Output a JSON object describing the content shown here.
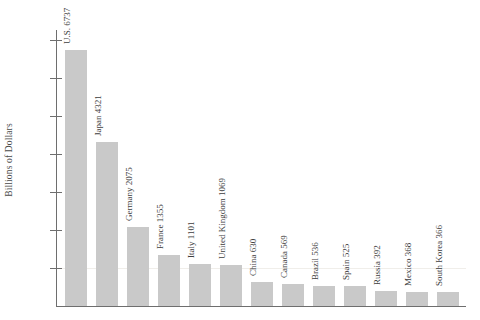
{
  "chart_data": {
    "type": "bar",
    "title": "",
    "subtitle": "",
    "xlabel": "",
    "ylabel": "Billions of Dollars",
    "ylim": [
      0,
      7400
    ],
    "grid": true,
    "legend": null,
    "tick_labels": [
      "7,000",
      "6,000",
      "5,000",
      "4,000",
      "3,000",
      "2,000",
      "1,000"
    ],
    "ticks": [
      7000,
      6000,
      5000,
      4000,
      3000,
      2000,
      1000
    ],
    "categories": [
      "U.S.",
      "Japan",
      "Germany",
      "France",
      "Italy",
      "United Kingdom",
      "China",
      "Canada",
      "Brazil",
      "Spain",
      "Russia",
      "Mexico",
      "South Korea"
    ],
    "values": [
      6737,
      4321,
      2075,
      1355,
      1101,
      1069,
      630,
      569,
      536,
      525,
      392,
      368,
      366
    ],
    "bar_labels": [
      "U.S. 6737",
      "Japan 4321",
      "Germany 2075",
      "France 1355",
      "Italy 1101",
      "United Kingdom 1069",
      "China 630",
      "Canada 569",
      "Brazil 536",
      "Spain 525",
      "Russia 392",
      "Mexico 368",
      "South Korea 366"
    ],
    "bar_color": "#c9c9c9",
    "axis_color": "#6e6e6e",
    "gridline_color": "#f0eeea",
    "text_color": "#3d3d3d"
  }
}
